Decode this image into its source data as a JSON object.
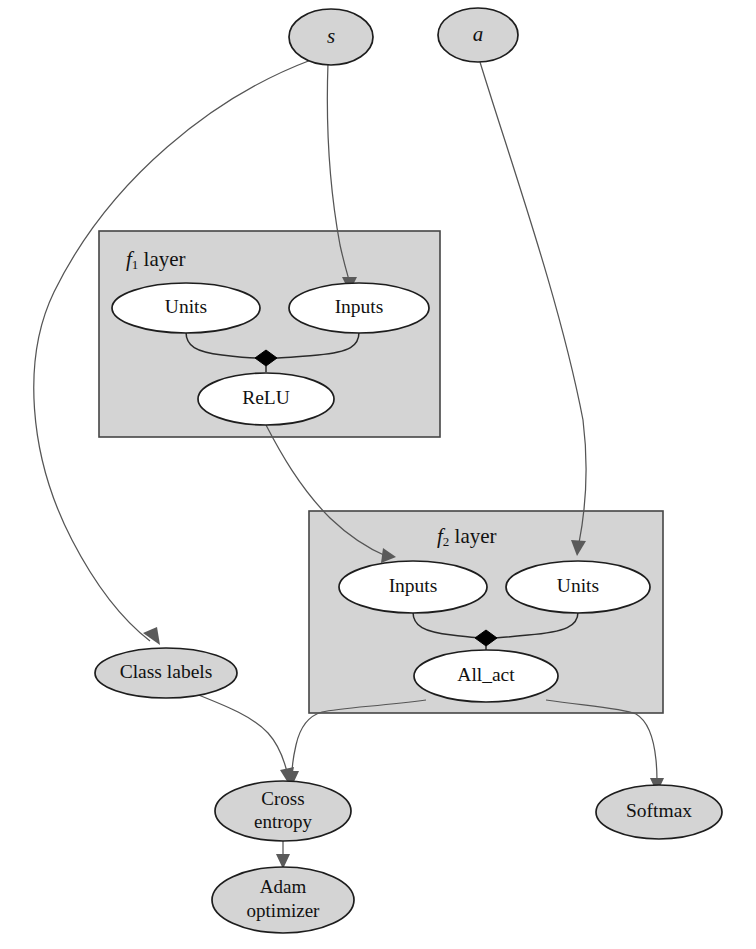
{
  "diagram": {
    "colors": {
      "node_fill": "#d4d4d4",
      "cluster_fill": "#d4d4d4",
      "node_stroke": "#1d1d1d",
      "cluster_stroke": "#454545",
      "edge_stroke": "#555555",
      "join_fill": "#000000",
      "background": "#ffffff"
    },
    "inputs": {
      "state_label": "s",
      "action_label": "a"
    },
    "clusters": [
      {
        "id": "f1",
        "label_fn": "f",
        "label_sub": "1",
        "label_suffix": " layer",
        "label_full": "f1 layer",
        "nodes": [
          {
            "id": "f1-units",
            "label": "Units"
          },
          {
            "id": "f1-inputs",
            "label": "Inputs"
          },
          {
            "id": "f1-relu",
            "label": "ReLU"
          }
        ]
      },
      {
        "id": "f2",
        "label_fn": "f",
        "label_sub": "2",
        "label_suffix": " layer",
        "label_full": "f2 layer",
        "nodes": [
          {
            "id": "f2-inputs",
            "label": "Inputs"
          },
          {
            "id": "f2-units",
            "label": "Units"
          },
          {
            "id": "f2-allact",
            "label": "All_act"
          }
        ]
      }
    ],
    "nodes": [
      {
        "id": "class-labels",
        "label": "Class labels"
      },
      {
        "id": "cross-entropy",
        "label_line1": "Cross",
        "label_line2": "entropy",
        "label": "Cross entropy"
      },
      {
        "id": "adam-optimizer",
        "label_line1": "Adam",
        "label_line2": "optimizer",
        "label": "Adam optimizer"
      },
      {
        "id": "softmax",
        "label": "Softmax"
      }
    ],
    "edges": [
      {
        "from": "s",
        "to": "f1-inputs"
      },
      {
        "from": "s",
        "to": "class-labels"
      },
      {
        "from": "a",
        "to": "f2-units"
      },
      {
        "from": "f1-units",
        "to": "f1-join"
      },
      {
        "from": "f1-inputs",
        "to": "f1-join"
      },
      {
        "from": "f1-join",
        "to": "f1-relu"
      },
      {
        "from": "f1-relu",
        "to": "f2-inputs"
      },
      {
        "from": "f2-inputs",
        "to": "f2-join"
      },
      {
        "from": "f2-units",
        "to": "f2-join"
      },
      {
        "from": "f2-join",
        "to": "f2-allact"
      },
      {
        "from": "f2-allact",
        "to": "cross-entropy"
      },
      {
        "from": "f2-allact",
        "to": "softmax"
      },
      {
        "from": "class-labels",
        "to": "cross-entropy"
      },
      {
        "from": "cross-entropy",
        "to": "adam-optimizer"
      }
    ]
  }
}
